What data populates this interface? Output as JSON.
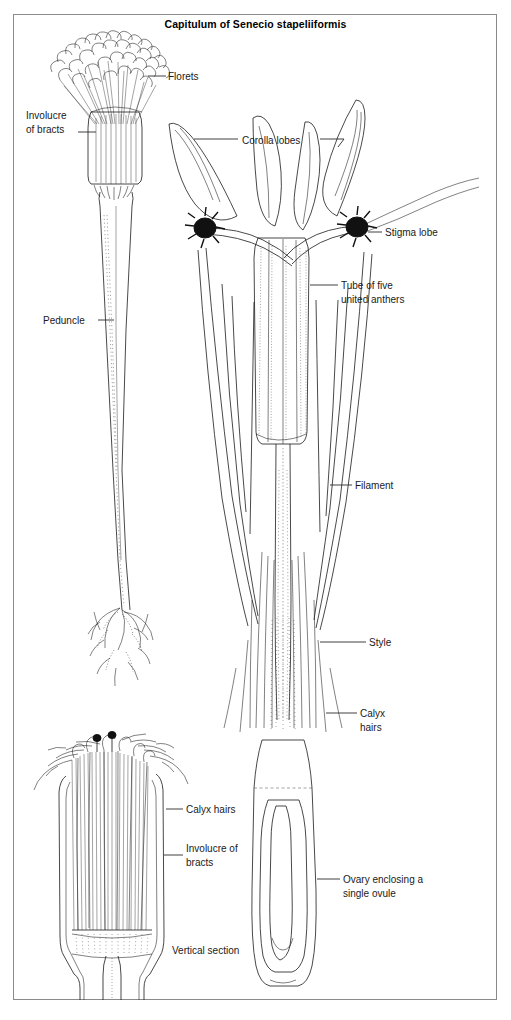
{
  "figure": {
    "title": "Capitulum of Senecio stapeliiformis",
    "style": "line-drawing",
    "colors": {
      "ink": "#1a1a1a",
      "paper": "#ffffff",
      "frame": "#8a8a8a"
    }
  },
  "labels": [
    {
      "id": "florets",
      "text": "Florets",
      "x": 168,
      "y": 80,
      "lines": [
        "Florets"
      ]
    },
    {
      "id": "involucre-top",
      "text": "Involucre of bracts",
      "x": 26,
      "y": 119,
      "lines": [
        "Involucre",
        "of bracts"
      ]
    },
    {
      "id": "corolla-lobes",
      "text": "Corolla lobes",
      "x": 242,
      "y": 144,
      "lines": [
        "Corolla lobes"
      ]
    },
    {
      "id": "stigma-lobe",
      "text": "Stigma lobe",
      "x": 385,
      "y": 235,
      "lines": [
        "Stigma lobe"
      ]
    },
    {
      "id": "anther-tube",
      "text": "Tube of five united anthers",
      "x": 341,
      "y": 289,
      "lines": [
        "Tube of five",
        "united anthers"
      ]
    },
    {
      "id": "peduncle",
      "text": "Peduncle",
      "x": 43,
      "y": 324,
      "lines": [
        "Peduncle"
      ]
    },
    {
      "id": "filament",
      "text": "Filament",
      "x": 355,
      "y": 488,
      "lines": [
        "Filament"
      ]
    },
    {
      "id": "style",
      "text": "Style",
      "x": 368,
      "y": 645,
      "lines": [
        "Style"
      ]
    },
    {
      "id": "calyx-hairs-r",
      "text": "Calyx hairs",
      "x": 360,
      "y": 717,
      "lines": [
        "Calyx",
        "hairs"
      ]
    },
    {
      "id": "calyx-hairs-l",
      "text": "Calyx hairs",
      "x": 186,
      "y": 812,
      "lines": [
        "Calyx hairs"
      ]
    },
    {
      "id": "involucre-bot",
      "text": "Involucre of bracts",
      "x": 186,
      "y": 851,
      "lines": [
        "Involucre of",
        "bracts"
      ]
    },
    {
      "id": "ovary",
      "text": "Ovary enclosing a single ovule",
      "x": 343,
      "y": 882,
      "lines": [
        "Ovary enclosing a",
        "single ovule"
      ]
    },
    {
      "id": "vertical-section",
      "text": "Vertical section",
      "x": 172,
      "y": 953,
      "lines": [
        "Vertical section"
      ]
    }
  ],
  "parts": [
    {
      "name": "capitulum-whole",
      "description": "Whole flower head with florets, involucre and long peduncle"
    },
    {
      "name": "floret-enlarged",
      "description": "Single enlarged floret showing corolla lobes, stigma, anther tube, style and ovary"
    },
    {
      "name": "capitulum-section",
      "description": "Vertical section of capitulum showing packed florets and calyx hairs"
    }
  ]
}
